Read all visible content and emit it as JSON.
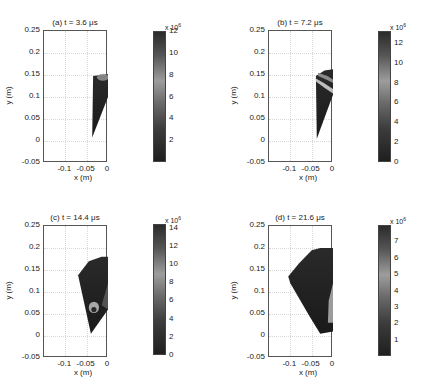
{
  "chart_data": [
    {
      "type": "heatmap",
      "panel": "a",
      "title": "(a)  t = 3.6 μs",
      "xlabel": "x (m)",
      "ylabel": "y (m)",
      "xlim": [
        -0.15,
        0
      ],
      "ylim": [
        -0.05,
        0.25
      ],
      "xticks": [
        "-0.1",
        "-0.05",
        "0"
      ],
      "yticks": [
        "0.25",
        "0.2",
        "0.15",
        "0.1",
        "0.05",
        "0",
        "-0.05"
      ],
      "grid": true,
      "colorbar": {
        "exponent": "x 10^6",
        "ticks": [
          "12",
          "10",
          "8",
          "6",
          "4",
          "2"
        ],
        "range": [
          0,
          12
        ]
      },
      "colormap": "dark-gray-light-gray-dark"
    },
    {
      "type": "heatmap",
      "panel": "b",
      "title": "(b)  t = 7.2 μs",
      "xlabel": "x (m)",
      "ylabel": "y (m)",
      "xlim": [
        -0.15,
        0
      ],
      "ylim": [
        -0.05,
        0.25
      ],
      "xticks": [
        "-0.1",
        "-0.05",
        "0"
      ],
      "yticks": [
        "0.25",
        "0.2",
        "0.15",
        "0.1",
        "0.05",
        "0",
        "-0.05"
      ],
      "grid": true,
      "colorbar": {
        "exponent": "x 10^6",
        "ticks": [
          "12",
          "10",
          "8",
          "6",
          "4",
          "2",
          "0"
        ],
        "range": [
          0,
          13
        ]
      }
    },
    {
      "type": "heatmap",
      "panel": "c",
      "title": "(c)  t = 14.4 μs",
      "xlabel": "x (m)",
      "ylabel": "y (m)",
      "xlim": [
        -0.15,
        0
      ],
      "ylim": [
        -0.05,
        0.25
      ],
      "xticks": [
        "-0.1",
        "-0.05",
        "0"
      ],
      "yticks": [
        "0.25",
        "0.2",
        "0.15",
        "0.1",
        "0.05",
        "0",
        "-0.05"
      ],
      "grid": true,
      "colorbar": {
        "exponent": "x 10^6",
        "ticks": [
          "14",
          "12",
          "10",
          "8",
          "6",
          "4",
          "2",
          "0"
        ],
        "range": [
          0,
          14
        ]
      }
    },
    {
      "type": "heatmap",
      "panel": "d",
      "title": "(d)  t = 21.6 μs",
      "xlabel": "x (m)",
      "ylabel": "y (m)",
      "xlim": [
        -0.15,
        0
      ],
      "ylim": [
        -0.05,
        0.25
      ],
      "xticks": [
        "-0.1",
        "-0.05",
        "0"
      ],
      "yticks": [
        "0.25",
        "0.2",
        "0.15",
        "0.1",
        "0.05",
        "0",
        "-0.05"
      ],
      "grid": true,
      "colorbar": {
        "exponent": "x 10^6",
        "ticks": [
          "7",
          "6",
          "5",
          "4",
          "3",
          "2",
          "1"
        ],
        "range": [
          0,
          8
        ]
      }
    }
  ],
  "panels": {
    "a": {
      "title": "(a)  t = 3.6 μs",
      "exp_base": "x 10",
      "exp_pow": "6",
      "cb": [
        "12",
        "10",
        "8",
        "6",
        "4",
        "2"
      ]
    },
    "b": {
      "title": "(b)  t = 7.2 μs",
      "exp_base": "x 10",
      "exp_pow": "6",
      "cb": [
        "12",
        "10",
        "8",
        "6",
        "4",
        "2",
        "0"
      ]
    },
    "c": {
      "title": "(c)  t = 14.4 μs",
      "exp_base": "x 10",
      "exp_pow": "6",
      "cb": [
        "14",
        "12",
        "10",
        "8",
        "6",
        "4",
        "2",
        "0"
      ]
    },
    "d": {
      "title": "(d)  t = 21.6 μs",
      "exp_base": "x 10",
      "exp_pow": "6",
      "cb": [
        "7",
        "6",
        "5",
        "4",
        "3",
        "2",
        "1"
      ]
    }
  },
  "axis": {
    "xlabel": "x (m)",
    "ylabel": "y (m)",
    "xticks": [
      "-0.1",
      "-0.05",
      "0"
    ],
    "yticks": [
      "0.25",
      "0.2",
      "0.15",
      "0.1",
      "0.05",
      "0",
      "-0.05"
    ]
  }
}
